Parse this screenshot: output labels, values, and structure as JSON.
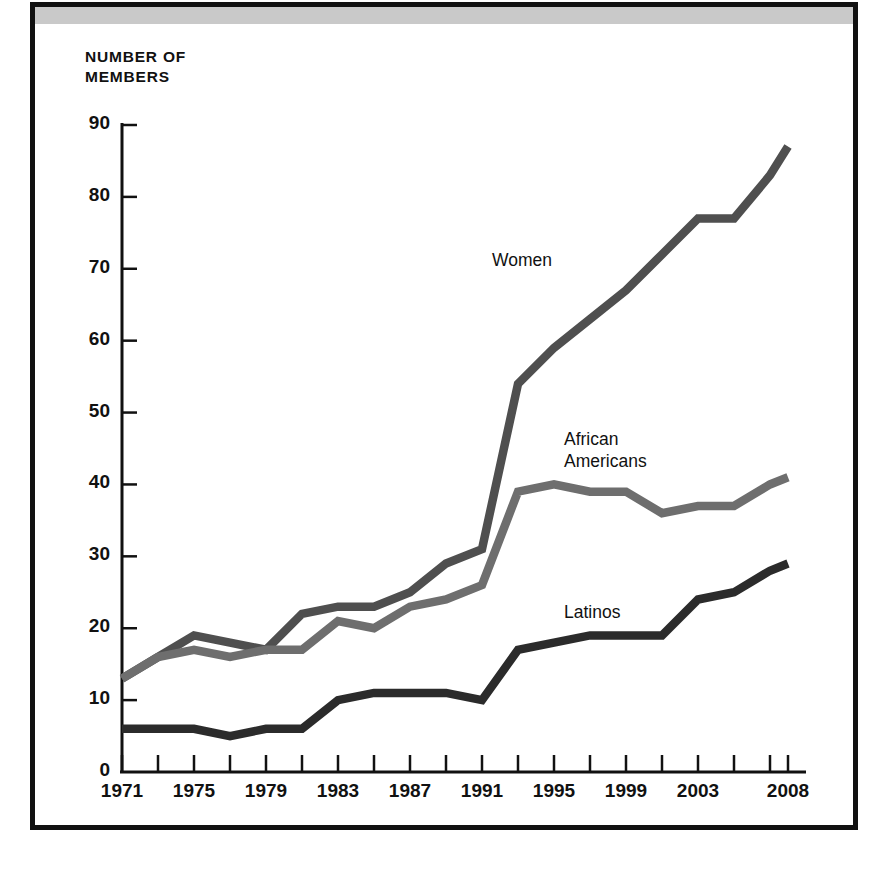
{
  "figure": {
    "y_axis_title": "NUMBER OF\nMEMBERS",
    "frame_color": "#111111",
    "band_color": "#c9c9c9",
    "background": "#ffffff"
  },
  "chart_data": {
    "type": "line",
    "title": "",
    "subtitle": "",
    "xlabel": "",
    "ylabel": "NUMBER OF MEMBERS",
    "xlim": [
      1971,
      2008
    ],
    "ylim": [
      0,
      90
    ],
    "grid": false,
    "legend_position": "inline-annotations",
    "y_ticks": [
      0,
      10,
      20,
      30,
      40,
      50,
      60,
      70,
      80,
      90
    ],
    "y_tick_labels": [
      "0",
      "10",
      "20",
      "30",
      "40",
      "50",
      "60",
      "70",
      "80",
      "90"
    ],
    "x_ticks": [
      1971,
      1973,
      1975,
      1977,
      1979,
      1981,
      1983,
      1985,
      1987,
      1989,
      1991,
      1993,
      1995,
      1997,
      1999,
      2001,
      2003,
      2005,
      2007,
      2008
    ],
    "x_tick_labels": [
      "1971",
      "1975",
      "1979",
      "1983",
      "1987",
      "1991",
      "1995",
      "1999",
      "2003",
      "2008"
    ],
    "x_labeled_ticks": [
      1971,
      1975,
      1979,
      1983,
      1987,
      1991,
      1995,
      1999,
      2003,
      2008
    ],
    "x": [
      1971,
      1973,
      1975,
      1977,
      1979,
      1981,
      1983,
      1985,
      1987,
      1989,
      1991,
      1993,
      1995,
      1997,
      1999,
      2001,
      2003,
      2005,
      2007,
      2008
    ],
    "series": [
      {
        "name": "Women",
        "color": "#4f4f4f",
        "values": [
          13,
          16,
          19,
          18,
          17,
          22,
          23,
          23,
          25,
          29,
          31,
          54,
          59,
          63,
          67,
          72,
          77,
          77,
          83,
          87
        ],
        "label_x": 1991,
        "label_y": 71
      },
      {
        "name": "African\nAmericans",
        "color": "#6e6e6e",
        "values": [
          13,
          16,
          17,
          16,
          17,
          17,
          21,
          20,
          23,
          24,
          26,
          39,
          40,
          39,
          39,
          36,
          37,
          37,
          40,
          41
        ],
        "label_x": 1995,
        "label_y": 46
      },
      {
        "name": "Latinos",
        "color": "#2b2b2b",
        "values": [
          6,
          6,
          6,
          5,
          6,
          6,
          10,
          11,
          11,
          11,
          10,
          17,
          18,
          19,
          19,
          19,
          24,
          25,
          28,
          29
        ],
        "label_x": 1995,
        "label_y": 22
      }
    ]
  },
  "series_labels": [
    {
      "text": "Women"
    },
    {
      "text": "African\nAmericans"
    },
    {
      "text": "Latinos"
    }
  ]
}
